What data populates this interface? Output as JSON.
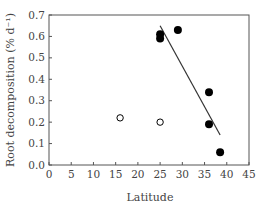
{
  "chart_data": {
    "type": "scatter",
    "title": "",
    "xlabel": "Latitude",
    "ylabel": "Root decomposition (% d⁻¹)",
    "xlim": [
      0,
      45
    ],
    "ylim": [
      0.0,
      0.7
    ],
    "xticks": [
      0,
      5,
      10,
      15,
      20,
      25,
      30,
      35,
      40,
      45
    ],
    "yticks": [
      "0.0",
      "0.1",
      "0.2",
      "0.3",
      "0.4",
      "0.5",
      "0.6",
      "0.7"
    ],
    "grid": false,
    "legend": null,
    "series": [
      {
        "name": "filled",
        "marker": "filled-circle",
        "color": "#000000",
        "points": [
          {
            "x": 25,
            "y": 0.61
          },
          {
            "x": 25,
            "y": 0.59
          },
          {
            "x": 29,
            "y": 0.63
          },
          {
            "x": 36,
            "y": 0.34
          },
          {
            "x": 36,
            "y": 0.19
          },
          {
            "x": 38.5,
            "y": 0.06
          }
        ]
      },
      {
        "name": "open",
        "marker": "open-circle",
        "color": "#000000",
        "points": [
          {
            "x": 16,
            "y": 0.22
          },
          {
            "x": 25,
            "y": 0.2
          }
        ]
      }
    ],
    "regression_line": {
      "x1": 25,
      "y1": 0.65,
      "x2": 38.5,
      "y2": 0.14
    }
  }
}
